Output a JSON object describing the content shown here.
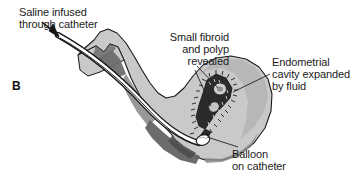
{
  "figure": {
    "panel_letter": "B",
    "background_color": "#ffffff"
  },
  "labels": {
    "saline": "Saline infused\nthrough catheter",
    "fibroid": "Small fibroid\nand polyp\nrevealed",
    "endometrial": "Endometrial\ncavity expanded\nby fluid",
    "balloon": "Balloon\non catheter"
  },
  "colors": {
    "outline": "#1a1a1a",
    "serosa_light_gray": "#c9c9c9",
    "myometrium_mid_gray": "#a6a6a6",
    "myometrium_dark_gray": "#6e6e6e",
    "cavity_dark": "#2b2b2b",
    "catheter_white": "#ffffff",
    "text": "#1b1b1b",
    "leader_line": "#222222"
  },
  "illustration": {
    "subject": "saline infusion sonohysterography of the uterus",
    "parts": [
      "uterine serosa outline",
      "myometrium shading",
      "cervical canal",
      "catheter tube",
      "inflated balloon on catheter",
      "distended endometrial cavity",
      "small fibroid",
      "endometrial polyp",
      "saline infusion arrow"
    ]
  }
}
